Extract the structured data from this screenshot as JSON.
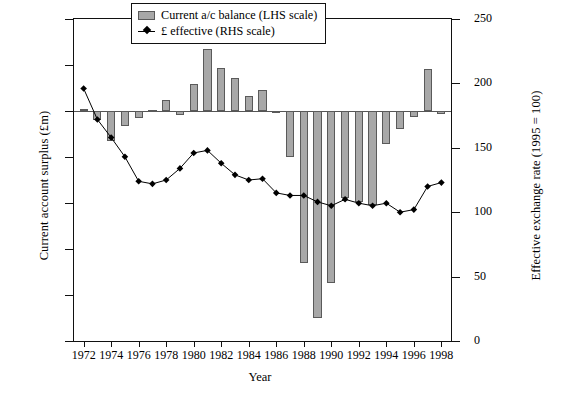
{
  "chart_data": {
    "type": "bar",
    "title": "",
    "xlabel": "Year",
    "ylabel": "Current account surplus (£m)",
    "y2label": "Effective exchange rate (1995 = 100)",
    "grid": false,
    "legend_position": "top-right",
    "xlim": [
      1971.3,
      1998.7
    ],
    "ylim": [
      -25000,
      10000
    ],
    "y2lim": [
      0,
      250
    ],
    "x_tick_labels": [
      "1972",
      "1974",
      "1976",
      "1978",
      "1980",
      "1982",
      "1984",
      "1986",
      "1988",
      "1990",
      "1992",
      "1994",
      "1996",
      "1998"
    ],
    "x_tick_values": [
      1972,
      1974,
      1976,
      1978,
      1980,
      1982,
      1984,
      1986,
      1988,
      1990,
      1992,
      1994,
      1996,
      1998
    ],
    "y_tick_labels": [
      "10 000",
      "5000",
      "0",
      "−5000",
      "−10 000",
      "−15 000",
      "−20 000",
      "−25 000"
    ],
    "y_tick_values": [
      10000,
      5000,
      0,
      -5000,
      -10000,
      -15000,
      -20000,
      -25000
    ],
    "y2_tick_labels": [
      "250",
      "200",
      "150",
      "100",
      "50",
      "0"
    ],
    "y2_tick_values": [
      250,
      200,
      150,
      100,
      50,
      0
    ],
    "categories": [
      1972,
      1973,
      1974,
      1975,
      1976,
      1977,
      1978,
      1979,
      1980,
      1981,
      1982,
      1983,
      1984,
      1985,
      1986,
      1987,
      1988,
      1989,
      1990,
      1991,
      1992,
      1993,
      1994,
      1995,
      1996,
      1997,
      1998
    ],
    "series": [
      {
        "name": "Current a/c balance (LHS scale)",
        "type": "bar",
        "axis": "left",
        "color": "#a8a8a8",
        "edge_color": "#5a5a5a",
        "values": [
          200,
          -1000,
          -3300,
          -1600,
          -800,
          100,
          1200,
          -400,
          2900,
          6700,
          4700,
          3600,
          1600,
          2300,
          -100,
          -5000,
          -16500,
          -22500,
          -18700,
          -9500,
          -9900,
          -10200,
          -3600,
          -2000,
          -600,
          4600,
          -300
        ]
      },
      {
        "name": "£ effective (RHS scale)",
        "type": "line",
        "axis": "right",
        "color": "#000000",
        "marker": "diamond",
        "values": [
          196,
          172,
          158,
          143,
          124,
          122,
          125,
          134,
          146,
          148,
          138,
          129,
          125,
          126,
          115,
          113,
          113,
          108,
          105,
          110,
          107,
          105,
          107,
          100,
          102,
          120,
          123
        ]
      }
    ]
  },
  "legend": {
    "items": [
      {
        "label": "Current a/c balance (LHS scale)",
        "marker": "bar-swatch"
      },
      {
        "label": "£ effective (RHS scale)",
        "marker": "line-diamond"
      }
    ]
  }
}
